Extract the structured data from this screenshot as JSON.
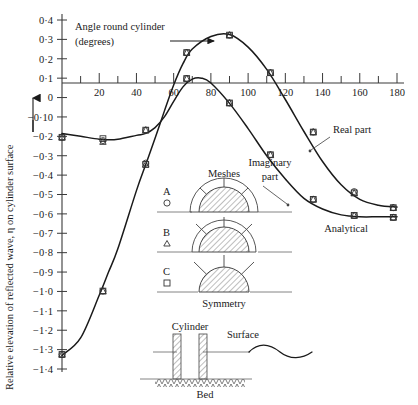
{
  "chart_data": {
    "type": "line",
    "title": "",
    "xlabel": "Angle round cylinder (degrees)",
    "ylabel": "Relative elevation of reflected wave, η on cylinder surface",
    "xlim": [
      0,
      180
    ],
    "ylim": [
      -1.4,
      0.4
    ],
    "grid": false,
    "legend_position": "inside-center",
    "x_ticks": [
      0,
      20,
      40,
      60,
      80,
      100,
      120,
      140,
      160,
      180
    ],
    "x_tick_labels": [
      "",
      "20",
      "40",
      "60",
      "80",
      "100",
      "120",
      "140",
      "160",
      "180"
    ],
    "x_minor_ticks": [
      10,
      30,
      50,
      70,
      90,
      110,
      130,
      150,
      170
    ],
    "y_ticks": [
      0.4,
      0.3,
      0.2,
      0.1,
      0,
      -0.1,
      -0.2,
      -0.3,
      -0.4,
      -0.5,
      -0.6,
      -0.7,
      -0.8,
      -0.9,
      -1.0,
      -1.1,
      -1.2,
      -1.3,
      -1.4
    ],
    "y_tick_labels": [
      "0·4",
      "0·3",
      "0·2",
      "0·1",
      "0",
      "−0·10",
      "−0·2",
      "−0·3",
      "−0·4",
      "−0·5",
      "−0·6",
      "−0·7",
      "−0·8",
      "−0·9",
      "−1·0",
      "−1·1",
      "−1·2",
      "−1·3",
      "−1·4"
    ],
    "series": [
      {
        "name": "Real part",
        "style": "analytical-curve",
        "x": [
          0,
          10,
          20,
          25,
          30,
          40,
          45,
          50,
          55,
          60,
          65,
          70,
          75,
          80,
          90,
          100,
          110,
          120,
          130,
          140,
          150,
          160,
          170,
          180
        ],
        "values": [
          -0.185,
          -0.2,
          -0.215,
          -0.218,
          -0.215,
          -0.195,
          -0.185,
          -0.155,
          -0.1,
          -0.02,
          0.055,
          0.095,
          0.1,
          0.075,
          -0.03,
          -0.16,
          -0.3,
          -0.42,
          -0.52,
          -0.575,
          -0.605,
          -0.615,
          -0.615,
          -0.615
        ]
      },
      {
        "name": "Imaginary part",
        "style": "analytical-curve",
        "x": [
          0,
          10,
          20,
          25,
          30,
          40,
          45,
          50,
          55,
          60,
          65,
          70,
          80,
          90,
          100,
          110,
          120,
          130,
          140,
          150,
          160,
          170,
          180
        ],
        "values": [
          -1.33,
          -1.24,
          -1.02,
          -0.9,
          -0.78,
          -0.48,
          -0.345,
          -0.21,
          -0.07,
          0.065,
          0.175,
          0.25,
          0.315,
          0.325,
          0.26,
          0.145,
          -0.01,
          -0.175,
          -0.33,
          -0.45,
          -0.525,
          -0.555,
          -0.565
        ]
      }
    ],
    "data_points": [
      {
        "mesh": "A",
        "marker": "circle",
        "series": "Real part",
        "x": [
          0,
          22,
          45,
          67,
          90,
          112,
          135,
          157,
          178
        ],
        "values": [
          -0.205,
          -0.222,
          -0.168,
          0.098,
          -0.028,
          -0.295,
          -0.525,
          -0.608,
          -0.618
        ]
      },
      {
        "mesh": "B",
        "marker": "triangle",
        "series": "Real part",
        "x": [
          0,
          22,
          45,
          67,
          90,
          112,
          135,
          157,
          178
        ],
        "values": [
          -0.205,
          -0.228,
          -0.168,
          0.098,
          -0.028,
          -0.295,
          -0.525,
          -0.608,
          -0.618
        ]
      },
      {
        "mesh": "C",
        "marker": "square",
        "series": "Real part",
        "x": [
          0,
          22,
          45,
          67,
          90,
          112,
          135,
          157,
          178
        ],
        "values": [
          -0.205,
          -0.212,
          -0.168,
          0.098,
          -0.028,
          -0.295,
          -0.525,
          -0.608,
          -0.618
        ]
      },
      {
        "mesh": "A",
        "marker": "circle",
        "series": "Imaginary part",
        "x": [
          0,
          22,
          45,
          67,
          90,
          112,
          135,
          157,
          178
        ],
        "values": [
          -1.325,
          -0.998,
          -0.338,
          0.232,
          0.322,
          0.128,
          -0.178,
          -0.485,
          -0.568
        ]
      },
      {
        "mesh": "B",
        "marker": "triangle",
        "series": "Imaginary part",
        "x": [
          0,
          22,
          45,
          67,
          90,
          112,
          135,
          157,
          178
        ],
        "values": [
          -1.325,
          -0.998,
          -0.345,
          0.232,
          0.322,
          0.128,
          -0.178,
          -0.492,
          -0.568
        ]
      },
      {
        "mesh": "C",
        "marker": "square",
        "series": "Imaginary part",
        "x": [
          0,
          22,
          45,
          67,
          90,
          112,
          135,
          157,
          178
        ],
        "values": [
          -1.325,
          -0.998,
          -0.345,
          0.232,
          0.322,
          0.128,
          -0.178,
          -0.492,
          -0.568
        ]
      }
    ],
    "annotations": [
      {
        "name": "real-part-label",
        "text": "Real part"
      },
      {
        "name": "imaginary-part-label",
        "text": "Imaginary\npart"
      },
      {
        "name": "analytical-label",
        "text": "Analytical"
      }
    ]
  },
  "axis": {
    "x_title_line1": "Angle round cylinder",
    "x_title_line2": "(degrees)",
    "y_title": "Relative elevation of reflected wave, η on cylinder surface",
    "x_labels": [
      "20",
      "40",
      "60",
      "80",
      "100",
      "120",
      "140",
      "160",
      "180"
    ],
    "y_labels": [
      "0·4",
      "0·3",
      "0·2",
      "0·1",
      "0",
      "−0·10",
      "−0·2",
      "−0·3",
      "−0·4",
      "−0·5",
      "−0·6",
      "−0·7",
      "−0·8",
      "−0·9",
      "−1·0",
      "−1·1",
      "−1·2",
      "−1·3",
      "−1·4"
    ]
  },
  "legend": {
    "title": "Meshes",
    "footer": "Symmetry",
    "items": [
      {
        "label": "A",
        "marker": "circle"
      },
      {
        "label": "B",
        "marker": "triangle"
      },
      {
        "label": "C",
        "marker": "square"
      }
    ]
  },
  "curve_labels": {
    "real": "Real part",
    "imaginary_line1": "Imaginary",
    "imaginary_line2": "part",
    "analytical": "Analytical"
  },
  "inset": {
    "cylinder_label": "Cylinder",
    "surface_label": "Surface",
    "bed_label": "Bed"
  }
}
